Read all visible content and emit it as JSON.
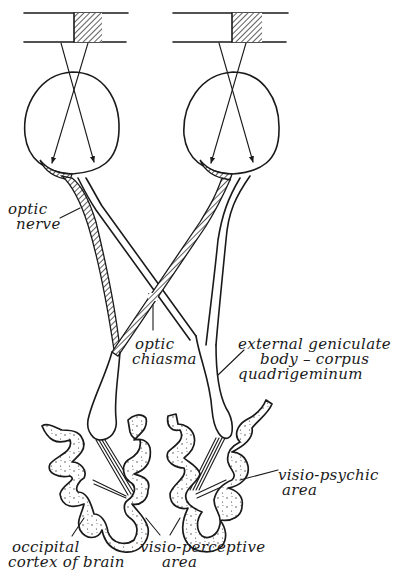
{
  "diagram": {
    "ink_color": "#1a1a1a",
    "background_color": "#ffffff",
    "labels": {
      "optic_nerve": {
        "line1": "optic",
        "line2": "nerve"
      },
      "optic_chiasma": {
        "line1": "optic",
        "line2": "chiasma"
      },
      "external_geniculate": {
        "line1": "external geniculate",
        "line2": "body – corpus",
        "line3": "quadrigeminum"
      },
      "visio_psychic": {
        "line1": "visio-psychic",
        "line2": "area"
      },
      "occipital_cortex": {
        "line1": "occipital",
        "line2": "cortex of brain"
      },
      "visio_perceptive": {
        "line1": "visio-perceptive",
        "line2": "area"
      }
    },
    "components": [
      "left-object-slit",
      "right-object-slit",
      "left-eyeball",
      "right-eyeball",
      "left-optic-nerve",
      "right-optic-nerve",
      "optic-chiasma",
      "left-geniculate-body",
      "right-geniculate-body",
      "left-occipital-cortex",
      "right-occipital-cortex"
    ]
  }
}
